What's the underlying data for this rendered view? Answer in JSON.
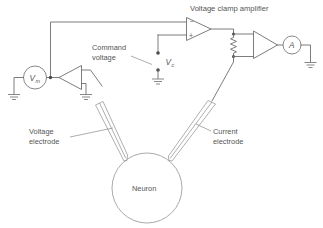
{
  "figure": {
    "type": "circuit-diagram",
    "background_color": "#ffffff",
    "line_color": "#6e6e6e",
    "text_color": "#555555"
  },
  "labels": {
    "voltage_clamp_amplifier": "Voltage clamp amplifier",
    "command_voltage_line1": "Command",
    "command_voltage_line2": "voltage",
    "voltage_electrode_line1": "Voltage",
    "voltage_electrode_line2": "electrode",
    "current_electrode_line1": "Current",
    "current_electrode_line2": "electrode",
    "neuron": "Neuron"
  },
  "symbols": {
    "membrane_potential": "V",
    "membrane_potential_sub": "m",
    "command_voltage": "V",
    "command_voltage_sub": "c",
    "ammeter": "A",
    "inverting_input": "−",
    "noninverting_input": "+"
  },
  "components": [
    {
      "name": "membrane-potential-meter",
      "kind": "meter",
      "label": "Vm"
    },
    {
      "name": "voltage-follower-amplifier",
      "kind": "amplifier"
    },
    {
      "name": "voltage-clamp-amplifier",
      "kind": "op-amp"
    },
    {
      "name": "feedback-resistor",
      "kind": "resistor"
    },
    {
      "name": "current-monitor-amplifier",
      "kind": "amplifier"
    },
    {
      "name": "ammeter",
      "kind": "meter",
      "label": "A"
    },
    {
      "name": "command-voltage-switch",
      "kind": "switch"
    },
    {
      "name": "neuron-soma",
      "kind": "cell-body",
      "label": "Neuron"
    },
    {
      "name": "voltage-electrode",
      "kind": "electrode"
    },
    {
      "name": "current-electrode",
      "kind": "electrode"
    }
  ]
}
